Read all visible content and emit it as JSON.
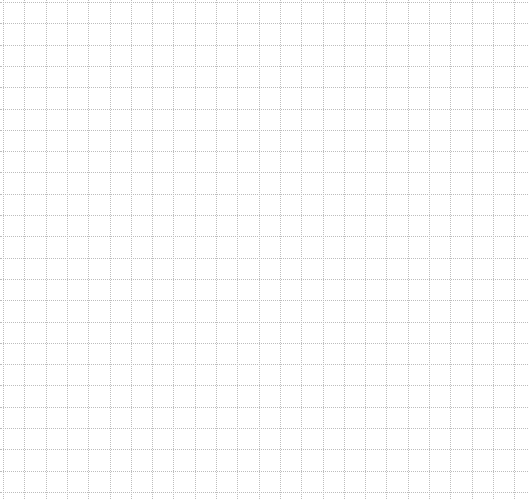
{
  "canvas": {
    "background": "#ffffff",
    "line_color": "#bdbdbd",
    "line_style": "dotted",
    "columns": 25,
    "rows": 24
  }
}
